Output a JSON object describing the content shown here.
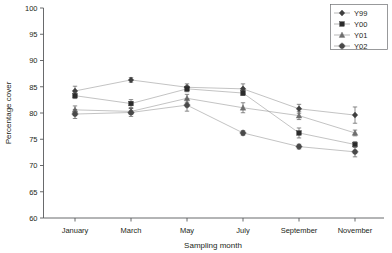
{
  "chart_data": {
    "type": "line",
    "title": "",
    "xlabel": "Sampling month",
    "ylabel": "Percentage cover",
    "categories": [
      "January",
      "March",
      "May",
      "July",
      "September",
      "November"
    ],
    "ylim": [
      60,
      100
    ],
    "yticks": [
      60,
      65,
      70,
      75,
      80,
      85,
      90,
      95,
      100
    ],
    "grid": false,
    "legend_position": "top-right",
    "error_bars": "standard error",
    "series": [
      {
        "name": "Y99",
        "marker": "diamond",
        "color": "#3f3f3f",
        "values": [
          84.2,
          86.3,
          84.9,
          84.6,
          80.8,
          79.6
        ],
        "errors": [
          0.9,
          0.45,
          0.65,
          0.95,
          0.85,
          1.55
        ]
      },
      {
        "name": "Y00",
        "marker": "square",
        "color": "#2b2b2b",
        "values": [
          83.3,
          81.8,
          84.6,
          83.8,
          76.2,
          74.0
        ],
        "errors": [
          0.55,
          0.75,
          0.55,
          0.45,
          0.95,
          0.55
        ]
      },
      {
        "name": "Y01",
        "marker": "triangle",
        "color": "#6e6e6e",
        "values": [
          80.6,
          80.3,
          82.8,
          81.0,
          79.5,
          76.2
        ],
        "errors": [
          0.75,
          0.55,
          0.75,
          0.95,
          0.75,
          0.55
        ]
      },
      {
        "name": "Y02",
        "marker": "circle-cross",
        "color": "#4a4a4a",
        "values": [
          79.8,
          80.1,
          81.5,
          76.2,
          73.6,
          72.6
        ],
        "errors": [
          0.85,
          0.75,
          1.15,
          0.45,
          0.45,
          0.95
        ]
      }
    ]
  },
  "legend": {
    "items": [
      {
        "label": "Y99"
      },
      {
        "label": "Y00"
      },
      {
        "label": "Y01"
      },
      {
        "label": "Y02"
      }
    ]
  },
  "axes": {
    "y_title": "Percentage cover",
    "x_title": "Sampling month",
    "ytick_labels": [
      "100",
      "95",
      "90",
      "85",
      "80",
      "75",
      "70",
      "65",
      "60"
    ],
    "xtick_labels": [
      "January",
      "March",
      "May",
      "July",
      "September",
      "November"
    ]
  }
}
